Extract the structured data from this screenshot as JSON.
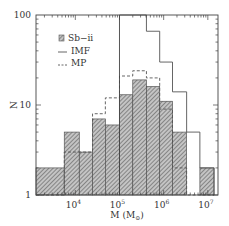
{
  "chart_data": {
    "type": "bar",
    "subtype": "histogram-step",
    "title": "",
    "xlabel": "M (M⊙)",
    "ylabel": "N",
    "xscale": "log",
    "yscale": "log",
    "xlim_log10": [
      3.11,
      7.23
    ],
    "ylim": [
      1,
      100
    ],
    "x_ticks": [
      {
        "log10": 4,
        "label": "10",
        "sup": "4"
      },
      {
        "log10": 5,
        "label": "10",
        "sup": "5"
      },
      {
        "log10": 6,
        "label": "10",
        "sup": "6"
      },
      {
        "log10": 7,
        "label": "10",
        "sup": "7"
      }
    ],
    "y_ticks": [
      {
        "value": 1,
        "label": "1"
      },
      {
        "value": 10,
        "label": "10"
      },
      {
        "value": 100,
        "label": "100"
      }
    ],
    "bin_edges_log10": [
      3.11,
      3.75,
      4.09,
      4.39,
      4.68,
      5.0,
      5.3,
      5.61,
      5.91,
      6.2,
      6.52,
      6.82,
      7.14
    ],
    "series": [
      {
        "name": "Sb−ii",
        "style": "hatched",
        "values": [
          2,
          5,
          3,
          7,
          6,
          13,
          19,
          16,
          11,
          5,
          1,
          2
        ]
      },
      {
        "name": "IMF",
        "style": "solid",
        "values": [
          null,
          null,
          null,
          null,
          null,
          100,
          100,
          66,
          30,
          14,
          5,
          2
        ]
      },
      {
        "name": "MP",
        "style": "dashed",
        "values": [
          1,
          3,
          3,
          8,
          12,
          21,
          24,
          20,
          9,
          2,
          1,
          1
        ]
      }
    ],
    "annotations": [
      {
        "type": "vline",
        "x_log10": 5.0,
        "style": "solid"
      }
    ],
    "legend": {
      "position": "upper-left",
      "entries": [
        "Sb−ii",
        "IMF",
        "MP"
      ]
    },
    "grid": false
  },
  "colors": {
    "axis": "#333333",
    "hatch": "#666666",
    "hatch_bg": "#bdbdbd",
    "line": "#555555"
  }
}
